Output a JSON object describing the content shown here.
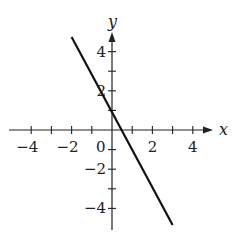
{
  "chart_data": {
    "type": "line",
    "title": "",
    "xlabel": "x",
    "ylabel": "y",
    "xlim": [
      -5,
      5
    ],
    "ylim": [
      -5,
      5
    ],
    "grid": false,
    "legend": null,
    "x_ticks": [
      -4,
      -3,
      -2,
      -1,
      0,
      1,
      2,
      3,
      4
    ],
    "y_ticks": [
      -4,
      -3,
      -2,
      -1,
      1,
      2,
      3,
      4
    ],
    "x_tick_labels": [
      {
        "value": -4,
        "text": "−4"
      },
      {
        "value": -2,
        "text": "−2"
      },
      {
        "value": 0,
        "text": "0"
      },
      {
        "value": 2,
        "text": "2"
      },
      {
        "value": 4,
        "text": "4"
      }
    ],
    "y_tick_labels": [
      {
        "value": 4,
        "text": "4"
      },
      {
        "value": 2,
        "text": "2"
      },
      {
        "value": -2,
        "text": "−2"
      },
      {
        "value": -4,
        "text": "−4"
      }
    ],
    "series": [
      {
        "name": "y = -2x + 1",
        "equation": "y = -2x + 1",
        "slope": -2,
        "intercept": 1,
        "x": [
          -2,
          3
        ],
        "y": [
          5,
          -5
        ],
        "color": "#111111"
      }
    ]
  },
  "labels": {
    "x_axis": "x",
    "y_axis": "y"
  }
}
